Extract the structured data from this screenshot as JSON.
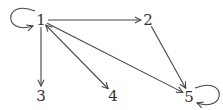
{
  "graph": {
    "directed": true,
    "colors": {
      "edge": "#444444",
      "label": "#333333",
      "background": "#ffffff"
    },
    "nodes": [
      {
        "id": "1",
        "label": "1"
      },
      {
        "id": "2",
        "label": "2"
      },
      {
        "id": "3",
        "label": "3"
      },
      {
        "id": "4",
        "label": "4"
      },
      {
        "id": "5",
        "label": "5"
      }
    ],
    "edges": [
      {
        "from": "1",
        "to": "1",
        "type": "self-loop"
      },
      {
        "from": "1",
        "to": "2",
        "type": "directed"
      },
      {
        "from": "1",
        "to": "3",
        "type": "directed"
      },
      {
        "from": "1",
        "to": "4",
        "type": "bidirectional"
      },
      {
        "from": "1",
        "to": "5",
        "type": "directed"
      },
      {
        "from": "2",
        "to": "5",
        "type": "directed"
      },
      {
        "from": "5",
        "to": "5",
        "type": "self-loop"
      }
    ]
  }
}
